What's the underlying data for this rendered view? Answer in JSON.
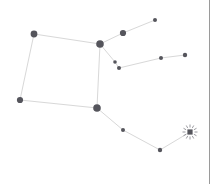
{
  "panel": {
    "title": "Constellation Map",
    "background_color": "#ffffff",
    "width": 217,
    "height": 184
  },
  "style": {
    "edge_color": "#d8d8d8",
    "node_color": "#55555c",
    "beacon_ray_color": "#8f8f95",
    "divider_color": "#9a9a9a"
  },
  "divider": {
    "name": "panel-divider",
    "x": 209,
    "width": 1
  },
  "gutter": {
    "x": 210,
    "width": 7
  },
  "chart_data": {
    "type": "scatter",
    "xlabel": "",
    "ylabel": "",
    "xlim": [
      0,
      217
    ],
    "ylim": [
      0,
      184
    ],
    "grid": false,
    "legend": null,
    "nodes": [
      {
        "id": "n1",
        "label": "",
        "x": 34,
        "y": 34,
        "r": 3.4,
        "kind": "star"
      },
      {
        "id": "n2",
        "label": "",
        "x": 100,
        "y": 44,
        "r": 3.8,
        "kind": "star"
      },
      {
        "id": "n3",
        "label": "",
        "x": 123,
        "y": 33,
        "r": 3.1,
        "kind": "star"
      },
      {
        "id": "n4",
        "label": "",
        "x": 155,
        "y": 20,
        "r": 2.0,
        "kind": "star"
      },
      {
        "id": "n5",
        "label": "",
        "x": 115,
        "y": 62,
        "r": 1.8,
        "kind": "star"
      },
      {
        "id": "n6",
        "label": "",
        "x": 119,
        "y": 68,
        "r": 2.0,
        "kind": "star"
      },
      {
        "id": "n7",
        "label": "",
        "x": 161,
        "y": 58,
        "r": 2.0,
        "kind": "star"
      },
      {
        "id": "n8",
        "label": "",
        "x": 185,
        "y": 55,
        "r": 2.2,
        "kind": "star"
      },
      {
        "id": "n9",
        "label": "",
        "x": 20,
        "y": 100,
        "r": 3.1,
        "kind": "star"
      },
      {
        "id": "n10",
        "label": "",
        "x": 97,
        "y": 108,
        "r": 3.8,
        "kind": "star"
      },
      {
        "id": "n11",
        "label": "",
        "x": 123,
        "y": 130,
        "r": 2.0,
        "kind": "star"
      },
      {
        "id": "n12",
        "label": "",
        "x": 160,
        "y": 150,
        "r": 2.2,
        "kind": "star"
      },
      {
        "id": "n13",
        "label": "",
        "x": 190,
        "y": 132,
        "r": 2.6,
        "kind": "beacon"
      }
    ],
    "edges": [
      {
        "from": "n1",
        "to": "n2"
      },
      {
        "from": "n1",
        "to": "n9"
      },
      {
        "from": "n9",
        "to": "n10"
      },
      {
        "from": "n2",
        "to": "n10"
      },
      {
        "from": "n2",
        "to": "n3"
      },
      {
        "from": "n3",
        "to": "n4"
      },
      {
        "from": "n2",
        "to": "n5"
      },
      {
        "from": "n5",
        "to": "n6"
      },
      {
        "from": "n6",
        "to": "n7"
      },
      {
        "from": "n7",
        "to": "n8"
      },
      {
        "from": "n10",
        "to": "n11"
      },
      {
        "from": "n11",
        "to": "n12"
      },
      {
        "from": "n12",
        "to": "n13"
      }
    ],
    "beacon": {
      "id": "n13",
      "ray_count": 12,
      "ray_inner": 4.5,
      "ray_outer": 7.5
    }
  }
}
